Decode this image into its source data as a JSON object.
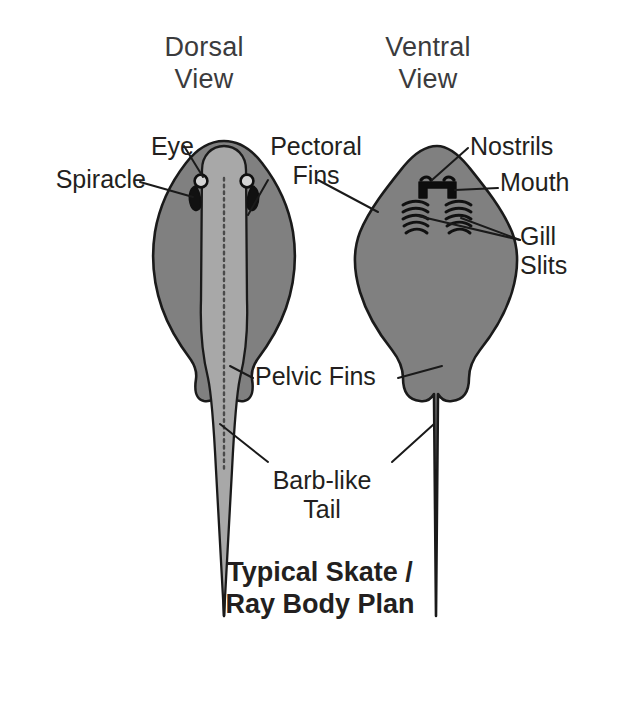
{
  "figure": {
    "title": "Typical Skate /\nRay Body Plan",
    "background_color": "#ffffff",
    "body_fill": "#808080",
    "ridge_fill": "#a8a8a8",
    "outline_color": "#1a1a1a",
    "text_color": "#231f20",
    "heading_color": "#3b3b3d"
  },
  "views": {
    "dorsal": {
      "heading": "Dorsal\nView",
      "heading_line1": "Dorsal",
      "heading_line2": "View"
    },
    "ventral": {
      "heading": "Ventral\nView",
      "heading_line1": "Ventral",
      "heading_line2": "View"
    }
  },
  "labels": {
    "eye": "Eye",
    "spiracle": "Spiracle",
    "pectoral_fins": "Pectoral\nFins",
    "nostrils": "Nostrils",
    "mouth": "Mouth",
    "gill_slits": "Gill\nSlits",
    "pelvic_fins": "Pelvic Fins",
    "barb_like_tail": "Barb-like\nTail"
  },
  "anatomy": {
    "parts": [
      {
        "name": "Eye",
        "view": "dorsal",
        "count": 2
      },
      {
        "name": "Spiracle",
        "view": "dorsal",
        "count": 2
      },
      {
        "name": "Pectoral Fins",
        "view": "both",
        "count": 2
      },
      {
        "name": "Nostrils",
        "view": "ventral",
        "count": 2
      },
      {
        "name": "Mouth",
        "view": "ventral",
        "count": 1
      },
      {
        "name": "Gill Slits",
        "view": "ventral",
        "count": 10
      },
      {
        "name": "Pelvic Fins",
        "view": "both",
        "count": 2
      },
      {
        "name": "Barb-like Tail",
        "view": "both",
        "count": 1
      }
    ],
    "gill_slits_per_side": 5
  }
}
